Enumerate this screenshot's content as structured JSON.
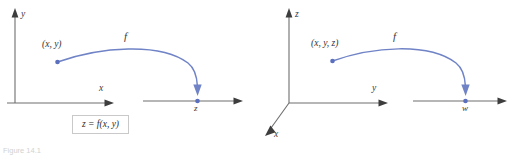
{
  "figure": {
    "number_label": "Figure 14.1",
    "accent_color": "#6f83c6",
    "axis_color": "#6e6e6e",
    "text_color": "#3a3a3a"
  },
  "panel_2d": {
    "name": "two-variable function diagram",
    "vertical_axis_label": "y",
    "horizontal_axis_label": "x",
    "domain_point_label": "(x, y)",
    "function_label": "f",
    "target_axis_label": "z",
    "caption": "z = f(x, y)"
  },
  "panel_3d": {
    "name": "three-variable function diagram",
    "vertical_axis_label": "z",
    "horizontal_axis_label": "y",
    "depth_axis_label": "x",
    "domain_point_label": "(x, y, z)",
    "function_label": "f",
    "target_axis_label": "w",
    "caption": "w = f(x, y, z)"
  }
}
